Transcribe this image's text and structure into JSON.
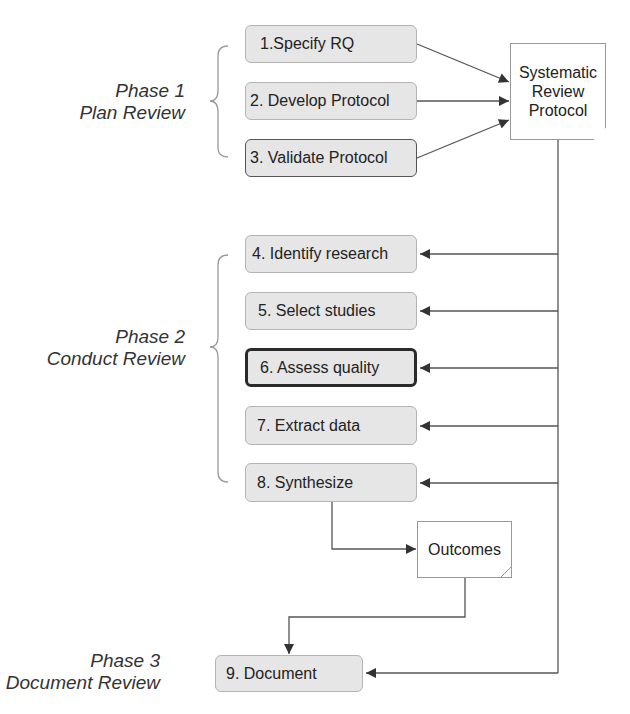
{
  "phases": [
    {
      "title": "Phase 1",
      "subtitle": "Plan Review"
    },
    {
      "title": "Phase 2",
      "subtitle": "Conduct Review"
    },
    {
      "title": "Phase 3",
      "subtitle": "Document Review"
    }
  ],
  "steps": [
    {
      "label": "1.Specify RQ"
    },
    {
      "label": "2. Develop Protocol"
    },
    {
      "label": "3. Validate Protocol"
    },
    {
      "label": "4. Identify research"
    },
    {
      "label": "5. Select studies"
    },
    {
      "label": "6. Assess quality"
    },
    {
      "label": "7. Extract data"
    },
    {
      "label": "8. Synthesize"
    },
    {
      "label": "9. Document"
    }
  ],
  "documents": {
    "protocol": {
      "line1": "Systematic",
      "line2": "Review",
      "line3": "Protocol"
    },
    "outcomes": {
      "label": "Outcomes"
    }
  },
  "colors": {
    "box_fill": "#e6e6e6",
    "line": "#555555",
    "highlight_border": "#2a2a2a"
  }
}
